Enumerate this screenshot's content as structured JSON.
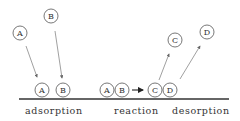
{
  "diagram": {
    "labels": {
      "adsorption": "adsorption",
      "reaction": "reaction",
      "desorption": "desorption"
    },
    "molecules": {
      "gas_a": "A",
      "gas_b": "B",
      "ads_a": "A",
      "ads_b": "B",
      "rx_a": "A",
      "rx_b": "B",
      "rx_c": "C",
      "rx_d": "D",
      "des_c": "C",
      "des_d": "D"
    },
    "reaction_arrow": "→",
    "colors": {
      "line": "#333333",
      "circle": "#555555",
      "text": "#333333"
    }
  }
}
